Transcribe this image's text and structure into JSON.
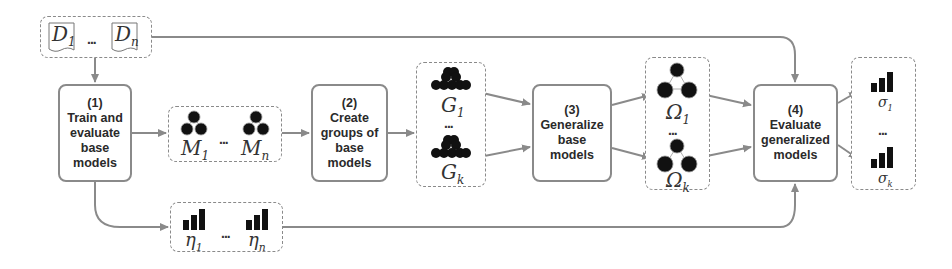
{
  "diagram": {
    "colors": {
      "line": "#8a8a8a",
      "arrow": "#8a8a8a",
      "text": "#2a2a2a",
      "glyph": "#111111"
    },
    "datasets": {
      "first": "D",
      "first_sub": "1",
      "last": "D",
      "last_sub": "n",
      "ellipsis": "..."
    },
    "steps": [
      {
        "num": "(1)",
        "lines": [
          "Train and",
          "evaluate",
          "base",
          "models"
        ]
      },
      {
        "num": "(2)",
        "lines": [
          "Create",
          "groups of",
          "base",
          "models"
        ]
      },
      {
        "num": "(3)",
        "lines": [
          "Generalize",
          "base",
          "models"
        ]
      },
      {
        "num": "(4)",
        "lines": [
          "Evaluate",
          "generalized",
          "models"
        ]
      }
    ],
    "base_models": {
      "first": "M",
      "first_sub": "1",
      "last": "M",
      "last_sub": "n",
      "ellipsis": "...",
      "icon": "tree-model-icon"
    },
    "base_scores": {
      "first": "η",
      "first_sub": "1",
      "last": "η",
      "last_sub": "n",
      "ellipsis": "...",
      "icon": "bar-chart-icon"
    },
    "groups": {
      "first": "G",
      "first_sub": "1",
      "last": "G",
      "last_sub": "k",
      "ellipsis": "...",
      "icon": "model-group-icon"
    },
    "generalized_models": {
      "first": "Ω",
      "first_sub": "1",
      "last": "Ω",
      "last_sub": "k",
      "ellipsis": "...",
      "icon": "tree-model-icon"
    },
    "generalized_scores": {
      "first": "σ",
      "first_sub": "1",
      "last": "σ",
      "last_sub": "k",
      "ellipsis": "...",
      "icon": "bar-chart-icon"
    }
  }
}
